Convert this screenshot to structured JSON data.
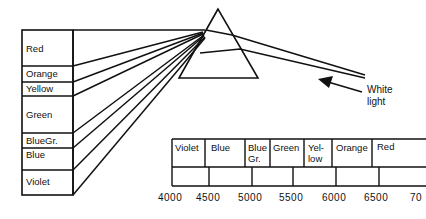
{
  "diagram": {
    "title": "",
    "spectrum_box": {
      "bands": [
        {
          "label": "Red"
        },
        {
          "label": "Orange"
        },
        {
          "label": "Yellow"
        },
        {
          "label": "Green"
        },
        {
          "label": "BlueGr."
        },
        {
          "label": "Blue"
        },
        {
          "label": "Violet"
        }
      ]
    },
    "prism_label": {
      "line1": "White",
      "line2": "light"
    },
    "wavelength_table": {
      "columns": [
        {
          "line1": "Violet",
          "line2": ""
        },
        {
          "line1": "Blue",
          "line2": ""
        },
        {
          "line1": "Blue",
          "line2": "Gr."
        },
        {
          "line1": "Green",
          "line2": ""
        },
        {
          "line1": "Yel-",
          "line2": "low"
        },
        {
          "line1": "Orange",
          "line2": ""
        },
        {
          "line1": "Red",
          "line2": ""
        }
      ],
      "ticks": [
        "4000",
        "4500",
        "5000",
        "5500",
        "6000",
        "6500",
        "70"
      ]
    }
  }
}
